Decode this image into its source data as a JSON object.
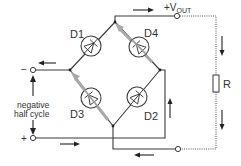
{
  "diagram": {
    "diodes": [
      {
        "id": "D1",
        "label": "D1",
        "conducting": false
      },
      {
        "id": "D4",
        "label": "D4",
        "conducting": true
      },
      {
        "id": "D3",
        "label": "D3",
        "conducting": true
      },
      {
        "id": "D2",
        "label": "D2",
        "conducting": false
      }
    ],
    "output_label_main": "+V",
    "output_label_sub": "OUT",
    "load_label": "R",
    "input_top_sign": "−",
    "input_bottom_sign": "+",
    "annotation_line1": "negative",
    "annotation_line2": "half cycle",
    "colors": {
      "wire": "#3a3a3a",
      "current_flow_highlight": "#a8a8a8",
      "arrow": "#222222"
    }
  }
}
